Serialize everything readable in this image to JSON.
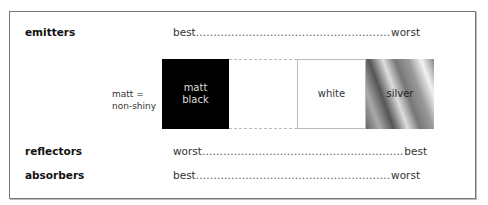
{
  "rows": {
    "emitters": {
      "label": "emitters",
      "start": "best",
      "end": "worst"
    },
    "reflectors": {
      "label": "reflectors",
      "start": "worst",
      "end": "best"
    },
    "absorbers": {
      "label": "absorbers",
      "start": "best",
      "end": "worst"
    }
  },
  "note": {
    "line1": "matt =",
    "line2": "non-shiny"
  },
  "surfaces": [
    {
      "name": "matt black",
      "line1": "matt",
      "line2": "black",
      "color": "#000000"
    },
    {
      "name": "blank",
      "line1": "",
      "line2": "",
      "color": "#ffffff"
    },
    {
      "name": "white",
      "line1": "white",
      "line2": "",
      "color": "#ffffff"
    },
    {
      "name": "silver",
      "line1": "silver",
      "line2": "",
      "color": "#aaaaaa"
    }
  ],
  "dots": "......................................................................................................"
}
